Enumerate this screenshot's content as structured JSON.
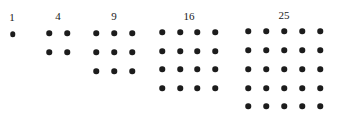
{
  "diagram": {
    "dot_color": "#1c1c1c",
    "groups": [
      {
        "label": "1",
        "n": 1,
        "label_pos": [
          12,
          17
        ],
        "x": [
          12.5
        ],
        "y": [
          34
        ]
      },
      {
        "label": "4",
        "n": 2,
        "label_pos": [
          58,
          16
        ],
        "x": [
          49,
          67
        ],
        "y": [
          33,
          52
        ]
      },
      {
        "label": "9",
        "n": 3,
        "label_pos": [
          114,
          16
        ],
        "x": [
          96,
          114,
          132
        ],
        "y": [
          33,
          52,
          71
        ]
      },
      {
        "label": "16",
        "n": 4,
        "label_pos": [
          189,
          16
        ],
        "x": [
          162,
          180,
          197,
          215
        ],
        "y": [
          32,
          51,
          69,
          88
        ]
      },
      {
        "label": "25",
        "n": 5,
        "label_pos": [
          284,
          15
        ],
        "x": [
          248,
          266,
          284,
          302,
          320
        ],
        "y": [
          31,
          50,
          69,
          88,
          106
        ]
      }
    ]
  }
}
